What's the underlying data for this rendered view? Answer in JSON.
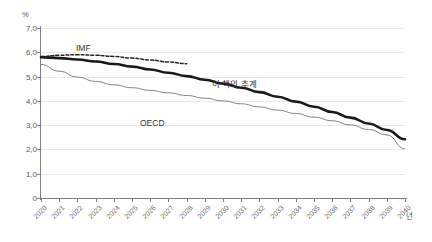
{
  "chart_data": {
    "type": "line",
    "title": "",
    "xlabel": "년",
    "ylabel": "%",
    "ylim": [
      0,
      7
    ],
    "xlim": [
      2020,
      2040
    ],
    "grid": true,
    "legend_position": "inline-annotations",
    "ytick_labels": [
      "7,0",
      "6,0",
      "5,0",
      "4,0",
      "3,0",
      "2,0",
      "1,0",
      "0"
    ],
    "ytick_values": [
      7.0,
      6.0,
      5.0,
      4.0,
      3.0,
      2.0,
      1.0,
      0.0
    ],
    "categories": [
      "2020",
      "2021",
      "2022",
      "2023",
      "2024",
      "2025",
      "2026",
      "2027",
      "2028",
      "2029",
      "2030",
      "2031",
      "2032",
      "2033",
      "2034",
      "2035",
      "2036",
      "2037",
      "2038",
      "2039",
      "2040"
    ],
    "series": [
      {
        "name": "이 책의 추계",
        "style": "thick-solid",
        "color": "#1a1a1a",
        "values": [
          5.8,
          5.76,
          5.7,
          5.62,
          5.52,
          5.41,
          5.29,
          5.16,
          5.02,
          4.87,
          4.71,
          4.54,
          4.36,
          4.17,
          3.97,
          3.76,
          3.54,
          3.31,
          3.07,
          2.8,
          2.42
        ]
      },
      {
        "name": "IMF",
        "style": "dashed",
        "color": "#262626",
        "values": [
          5.82,
          5.88,
          5.9,
          5.88,
          5.83,
          5.76,
          5.68,
          5.6,
          5.53,
          null,
          null,
          null,
          null,
          null,
          null,
          null,
          null,
          null,
          null,
          null,
          null
        ]
      },
      {
        "name": "OECD",
        "style": "thin-solid",
        "color": "#737373",
        "values": [
          5.5,
          5.22,
          4.98,
          4.8,
          4.66,
          4.54,
          4.43,
          4.33,
          4.22,
          4.11,
          4.0,
          3.88,
          3.75,
          3.62,
          3.48,
          3.33,
          3.18,
          3.01,
          2.82,
          2.6,
          2.02
        ]
      }
    ],
    "annotations": [
      {
        "text": "IMF",
        "series": "IMF"
      },
      {
        "text": "이 책의 추계",
        "series": "이 책의 추계"
      },
      {
        "text": "OECD",
        "series": "OECD"
      }
    ]
  },
  "axes": {
    "y_unit": "%",
    "x_unit": "년"
  }
}
